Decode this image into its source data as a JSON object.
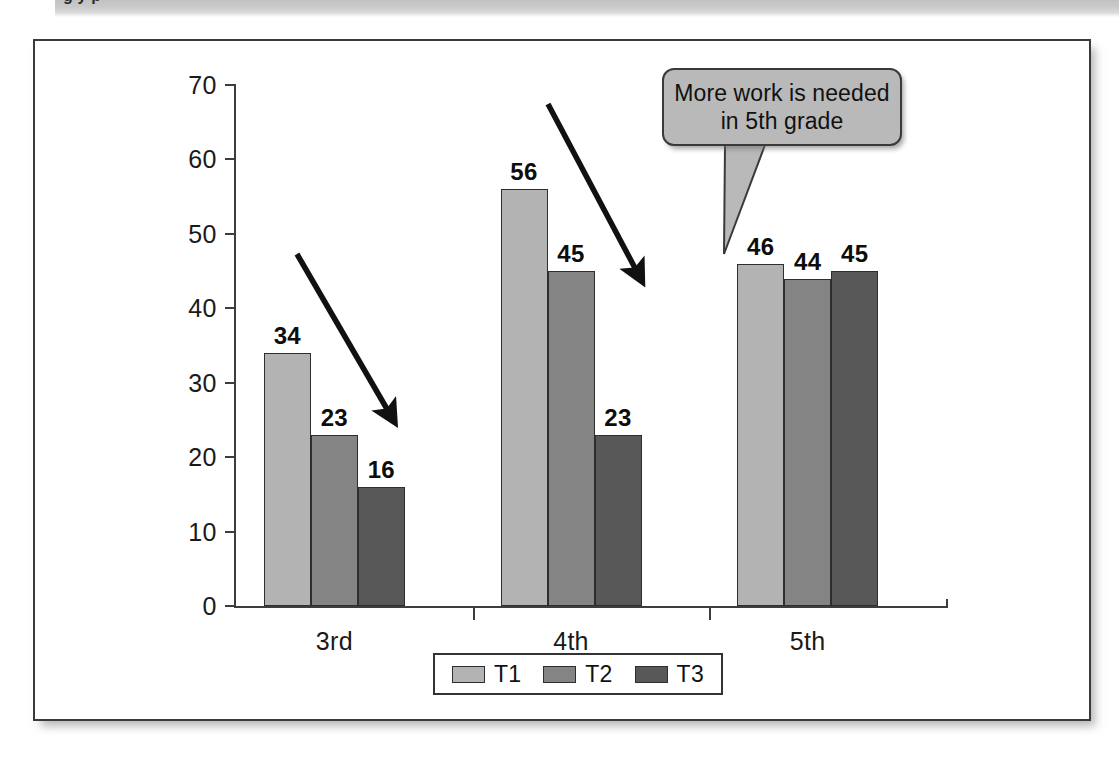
{
  "banner": {
    "text": "g                                                y                                 p"
  },
  "chart_data": {
    "type": "bar",
    "title": "",
    "xlabel": "",
    "ylabel": "",
    "categories": [
      "3rd",
      "4th",
      "5th"
    ],
    "series": [
      {
        "name": "T1",
        "values": [
          34,
          56,
          46
        ],
        "color": "#b3b3b3"
      },
      {
        "name": "T2",
        "values": [
          23,
          45,
          44
        ],
        "color": "#848484"
      },
      {
        "name": "T3",
        "values": [
          16,
          23,
          45
        ],
        "color": "#585858"
      }
    ],
    "ylim": [
      0,
      70
    ],
    "yticks": [
      0,
      10,
      20,
      30,
      40,
      50,
      60,
      70
    ],
    "ytick_labels": [
      "0",
      "10",
      "20",
      "30",
      "40",
      "50",
      "60",
      "70"
    ],
    "grid": false,
    "legend_position": "bottom",
    "data_labels": true,
    "annotations": [
      {
        "name": "callout",
        "text": "More work is needed in 5th grade",
        "line1": "More work is needed",
        "line2": "in 5th grade"
      },
      {
        "name": "arrow-3rd",
        "description": "downward-right arrow over 3rd grade group"
      },
      {
        "name": "arrow-4th",
        "description": "downward-right arrow over 4th grade group"
      }
    ]
  },
  "legend": {
    "items": [
      {
        "label": "T1",
        "color": "#b3b3b3"
      },
      {
        "label": "T2",
        "color": "#848484"
      },
      {
        "label": "T3",
        "color": "#585858"
      }
    ]
  }
}
